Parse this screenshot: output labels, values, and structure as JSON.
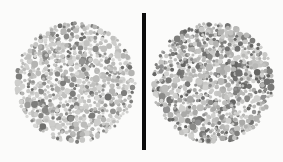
{
  "figure": {
    "type": "color-vision-test-plates",
    "width": 283,
    "height": 162,
    "background_color": "#fbfbfa",
    "caption": "",
    "title": ""
  },
  "divider": {
    "name": "vertical-separator-bar",
    "color": "#0b0b0b",
    "x": 142,
    "y": 13,
    "width": 4,
    "height": 137
  },
  "plates": [
    {
      "id": "left",
      "label": "Left Ishihara plate",
      "hidden_figure": "",
      "cx": 75.5,
      "cy": 82.5,
      "radius": 61.5,
      "dot_count": 780,
      "seed": 1337,
      "dot_radius_min": 1.5,
      "dot_radius_max": 3.6,
      "background_color": "#fbfbfa",
      "palette_light": [
        "#d2d2d0",
        "#c6c6c4",
        "#bcbcba",
        "#cdcdcb",
        "#c1c1bf",
        "#b4b4b2",
        "#d8d8d6"
      ],
      "palette_dark": [
        "#8a8a88",
        "#7d7d7b",
        "#949492",
        "#70706e",
        "#868684",
        "#9c9c9a"
      ],
      "dark_fraction": 0.3
    },
    {
      "id": "right",
      "label": "Right Ishihara plate",
      "hidden_figure": "",
      "cx": 213.0,
      "cy": 83.0,
      "radius": 62.0,
      "dot_count": 800,
      "seed": 90210,
      "dot_radius_min": 1.5,
      "dot_radius_max": 3.8,
      "background_color": "#fbfbfa",
      "palette_light": [
        "#c9c9c7",
        "#bdbdbb",
        "#b2b2b0",
        "#c4c4c2",
        "#b8b8b6",
        "#aaaaa8",
        "#d0d0ce"
      ],
      "palette_dark": [
        "#7e7e7c",
        "#717170",
        "#8a8a88",
        "#656563",
        "#797977",
        "#909090"
      ],
      "dark_fraction": 0.34
    }
  ]
}
